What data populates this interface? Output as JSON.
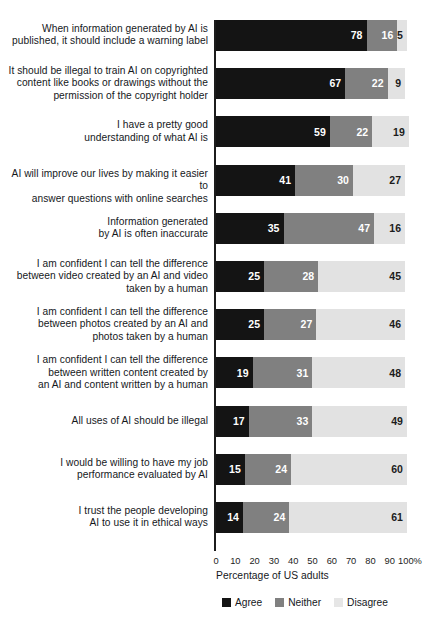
{
  "chart_data": {
    "type": "bar",
    "subtype": "stacked-horizontal-100",
    "title": "",
    "xlabel": "Percentage of US adults",
    "ylabel": "",
    "xlim": [
      0,
      100
    ],
    "xticks": [
      "0",
      "10",
      "20",
      "30",
      "40",
      "50",
      "60",
      "70",
      "80",
      "90",
      "100%"
    ],
    "grid": false,
    "legend_position": "bottom-left",
    "legend": [
      "Agree",
      "Neither",
      "Disagree"
    ],
    "colors": {
      "agree": "#141414",
      "neither": "#808080",
      "disagree": "#e2e2e2",
      "axis": "#1c1c1c",
      "text": "#15181c"
    },
    "categories": [
      "When information generated by AI is published, it should include a warning label",
      "It should be illegal to train AI on copyrighted content like books or drawings without the permission of the copyright holder",
      "I have a pretty good understanding of what AI is",
      "AI will improve our lives by making it easier to answer questions with online searches",
      "Information generated by AI is often inaccurate",
      "I am confident I can tell the difference between video created by an AI and video taken by a human",
      "I am confident I can tell the difference between photos created by an AI and photos taken by a human",
      "I am confident I can tell the difference between written content created by an AI and content written by a human",
      "All uses of AI should be illegal",
      "I would be willing to have my job performance evaluated by AI",
      "I trust the people developing AI to use it in ethical ways"
    ],
    "series": [
      {
        "name": "Agree",
        "values": [
          78,
          67,
          59,
          41,
          35,
          25,
          25,
          19,
          17,
          15,
          14
        ]
      },
      {
        "name": "Neither",
        "values": [
          16,
          22,
          22,
          30,
          47,
          28,
          27,
          31,
          33,
          24,
          24
        ]
      },
      {
        "name": "Disagree",
        "values": [
          5,
          9,
          19,
          27,
          16,
          45,
          46,
          48,
          49,
          60,
          61
        ]
      }
    ],
    "category_label_lines": [
      [
        "When information generated by AI is",
        "published, it should include a warning label"
      ],
      [
        "It should be illegal to train AI on copyrighted",
        "content like books or drawings without the",
        "permission of the copyright holder"
      ],
      [
        "I have a pretty good",
        "understanding of what AI is"
      ],
      [
        "AI will improve our lives by making it easier to",
        "answer questions with online searches"
      ],
      [
        "Information generated",
        "by AI is often inaccurate"
      ],
      [
        "I am confident I can tell the difference",
        "between video created by an AI and video",
        "taken by a human"
      ],
      [
        "I am confident I can tell the difference",
        "between photos created by an AI and",
        "photos taken by a human"
      ],
      [
        "I am confident I can tell the difference",
        "between written content created by",
        "an AI and content written by a human"
      ],
      [
        "All uses of AI should be illegal"
      ],
      [
        "I would be willing to have my job",
        "performance evaluated by AI"
      ],
      [
        "I trust the people developing",
        "AI to use it in ethical ways"
      ]
    ]
  }
}
